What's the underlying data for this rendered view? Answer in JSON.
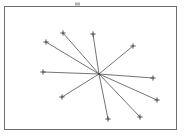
{
  "figure": {
    "canvas": {
      "width": 192,
      "height": 136
    },
    "colors": {
      "background": "#ffffff",
      "frame_stroke": "#6e6e6e",
      "ray_stroke": "#5a5a5a",
      "marker_stroke": "#3d3d3d",
      "hub_fill": "#4a4a4a",
      "smudge_fill": "#b4b4b4"
    },
    "frame": {
      "x": 4.5,
      "y": 6.5,
      "width": 172,
      "height": 123
    },
    "hub": {
      "x": 99,
      "y": 74,
      "radius": 1.1,
      "label": "center-hub"
    },
    "marker": {
      "shape": "plus",
      "arm_length": 2.6
    },
    "smudge": {
      "x": 75,
      "y": 2.5,
      "width": 5,
      "height": 3
    }
  },
  "chart_data": {
    "type": "scatter",
    "subtitle": "",
    "xlabel": "",
    "ylabel": "",
    "xlim": [
      4,
      177
    ],
    "ylim": [
      6,
      130
    ],
    "grid": false,
    "legend": null,
    "center": {
      "x": 99,
      "y": 74
    },
    "series": [
      {
        "name": "rays",
        "values": [
          {
            "id": "ray-1",
            "label": "upper-left-outer",
            "x": 46,
            "y": 42,
            "angle_deg": 149
          },
          {
            "id": "ray-2",
            "label": "upper-left-inner",
            "x": 63,
            "y": 33,
            "angle_deg": 130
          },
          {
            "id": "ray-3",
            "label": "top-center",
            "x": 93,
            "y": 34,
            "angle_deg": 99
          },
          {
            "id": "ray-4",
            "label": "upper-right",
            "x": 133,
            "y": 46,
            "angle_deg": 35
          },
          {
            "id": "ray-5",
            "label": "left",
            "x": 43,
            "y": 72,
            "angle_deg": 178
          },
          {
            "id": "ray-6",
            "label": "right",
            "x": 153,
            "y": 78,
            "angle_deg": -4
          },
          {
            "id": "ray-7",
            "label": "lower-left",
            "x": 62,
            "y": 97,
            "angle_deg": -149
          },
          {
            "id": "ray-8",
            "label": "bottom-center",
            "x": 108,
            "y": 119,
            "angle_deg": -79
          },
          {
            "id": "ray-9",
            "label": "lower-right-near",
            "x": 140,
            "y": 117,
            "angle_deg": -46
          },
          {
            "id": "ray-10",
            "label": "lower-right-far",
            "x": 157,
            "y": 100,
            "angle_deg": -23
          }
        ]
      }
    ],
    "ray_count": 10,
    "annotations": []
  }
}
